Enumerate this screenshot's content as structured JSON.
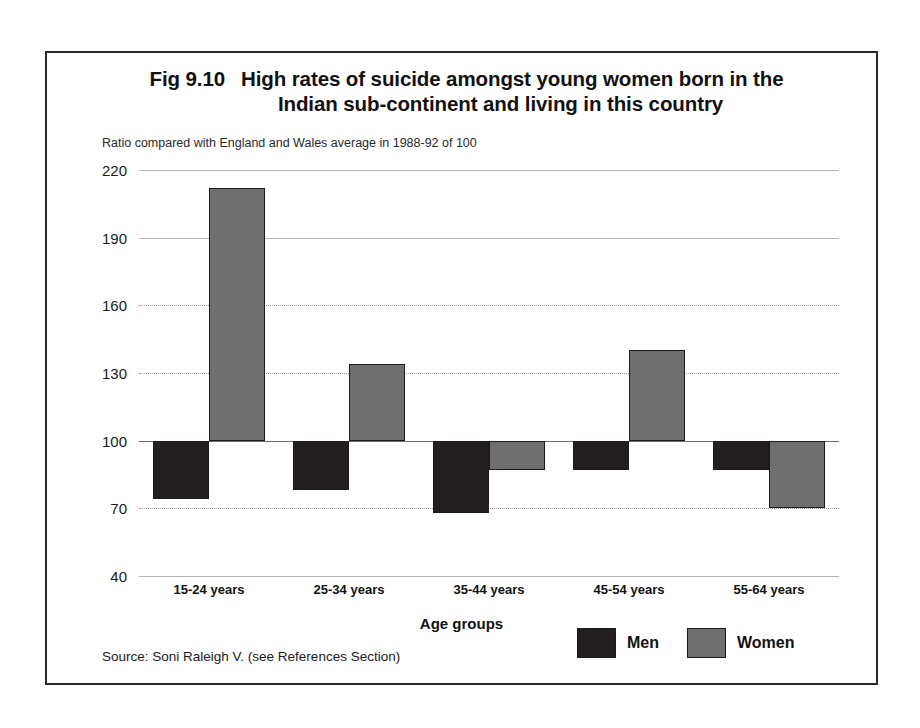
{
  "figure": {
    "number": "Fig 9.10",
    "title_line_1": "High rates of suicide amongst young women born in the",
    "title_line_2": "Indian sub-continent and living in this country",
    "subtitle": "Ratio compared with England and Wales average in 1988-92 of 100",
    "source": "Source: Soni Raleigh V. (see References Section)"
  },
  "chart_data": {
    "type": "bar",
    "subtitle": "Ratio compared with England and Wales average in 1988-92 of 100",
    "xlabel": "Age groups",
    "ylabel": "",
    "ylim": [
      40,
      220
    ],
    "yticks": [
      220,
      190,
      160,
      130,
      100,
      70,
      40
    ],
    "ytick_labels": [
      "220",
      "190",
      "160",
      "130",
      "100",
      "70",
      "40"
    ],
    "baseline": 100,
    "grid": true,
    "legend_position": "bottom-right",
    "categories": [
      "15-24 years",
      "25-34 years",
      "35-44 years",
      "45-54 years",
      "55-64 years"
    ],
    "series": [
      {
        "name": "Men",
        "color": "#231f20",
        "values": [
          74,
          78,
          68,
          87,
          87
        ]
      },
      {
        "name": "Women",
        "color": "#6f6f6f",
        "values": [
          212,
          134,
          87,
          140,
          70
        ]
      }
    ],
    "annotations": []
  },
  "legend": {
    "items": [
      {
        "label": "Men",
        "color": "#231f20"
      },
      {
        "label": "Women",
        "color": "#6f6f6f"
      }
    ]
  },
  "axis": {
    "x_title": "Age groups"
  }
}
